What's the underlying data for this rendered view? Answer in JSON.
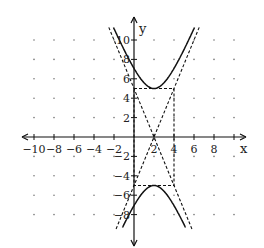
{
  "chart_data": {
    "type": "line",
    "title": "",
    "xlabel": "x",
    "ylabel": "y",
    "xlim": [
      -10,
      10
    ],
    "ylim": [
      -10,
      10
    ],
    "x_ticks": [
      -10,
      -8,
      -6,
      -4,
      -2,
      2,
      4,
      6,
      8
    ],
    "y_ticks": [
      10,
      8,
      6,
      4,
      2,
      -2,
      -4,
      -6,
      -8
    ],
    "grid": "dots every 2 units",
    "series": [
      {
        "name": "hyperbola",
        "equation": "y^2/25 - (x-2)^2/4 = 1",
        "style": "solid",
        "center": [
          2,
          0
        ],
        "vertices": [
          [
            2,
            5
          ],
          [
            2,
            -5
          ]
        ]
      },
      {
        "name": "asymptote 1",
        "equation": "y = 2.5(x-2)",
        "style": "dashed"
      },
      {
        "name": "asymptote 2",
        "equation": "y = -2.5(x-2)",
        "style": "dashed"
      },
      {
        "name": "fundamental rectangle",
        "corners": [
          [
            0,
            5
          ],
          [
            4,
            5
          ],
          [
            4,
            -5
          ],
          [
            0,
            -5
          ]
        ],
        "style": "dashed"
      }
    ]
  },
  "labels": {
    "x_axis": "x",
    "y_axis": "y",
    "x_ticks": [
      "-10",
      "-8",
      "-6",
      "-4",
      "-2",
      "2",
      "4",
      "6",
      "8"
    ],
    "y_ticks": [
      "10",
      "8",
      "6",
      "4",
      "2",
      "-2",
      "-4",
      "-6",
      "-8"
    ]
  }
}
